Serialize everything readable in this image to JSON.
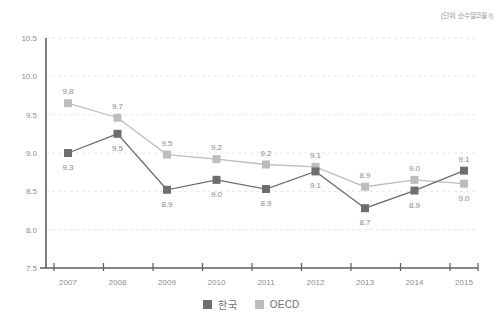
{
  "unit_note": "(단위: 순수알코올 ℓ)",
  "legend": {
    "position": "bottom-center",
    "entries": [
      {
        "label": "한국",
        "color": "#6e6e6e"
      },
      {
        "label": "OECD",
        "color": "#bdbdbd"
      }
    ]
  },
  "chart_data": {
    "type": "line",
    "title": "",
    "subtitle": "",
    "xlabel": "",
    "ylabel": "",
    "unit": "(단위: 순수알코올 ℓ)",
    "grid": true,
    "legend_position": "bottom-center",
    "categories": [
      "2007",
      "2008",
      "2009",
      "2010",
      "2011",
      "2012",
      "2013",
      "2014",
      "2015"
    ],
    "x": [
      2007,
      2008,
      2009,
      2010,
      2011,
      2012,
      2013,
      2014,
      2015
    ],
    "ylim": [
      7.5,
      10.5
    ],
    "yticks": [
      "10.5",
      "10.0",
      "9.5",
      "9.0",
      "8.5",
      "8.0",
      "7.5"
    ],
    "ytick_values": [
      10.5,
      10.0,
      9.5,
      9.0,
      8.5,
      8.0,
      7.5
    ],
    "series": [
      {
        "name": "한국",
        "color": "#6e6e6e",
        "marker": "square",
        "values": [
          9.0,
          9.25,
          8.52,
          8.65,
          8.53,
          8.76,
          8.28,
          8.51,
          8.77
        ],
        "data_labels": [
          "9.3",
          "9.5",
          "8.9",
          "9.0",
          "8.9",
          "9.1",
          "8.7",
          "8.9",
          "9.1"
        ],
        "label_positions": [
          "below",
          "below",
          "below",
          "below",
          "below",
          "below",
          "below",
          "below",
          "above"
        ]
      },
      {
        "name": "OECD",
        "color": "#bdbdbd",
        "marker": "square",
        "values": [
          9.65,
          9.46,
          8.98,
          8.92,
          8.85,
          8.82,
          8.56,
          8.65,
          8.6
        ],
        "data_labels": [
          "9.8",
          "9.7",
          "9.5",
          "9.2",
          "9.2",
          "9.1",
          "8.9",
          "9.0",
          "9.0"
        ],
        "label_positions": [
          "above",
          "above",
          "above",
          "above",
          "above",
          "above",
          "above",
          "above",
          "below"
        ]
      }
    ]
  }
}
